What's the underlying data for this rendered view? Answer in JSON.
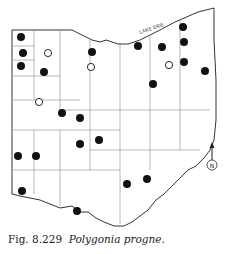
{
  "map": {
    "region": "Ohio",
    "lake_label": "LAKE ERIE",
    "compass_label": "N",
    "colors": {
      "outline": "#333333",
      "county": "#888888",
      "dot": "#111111"
    },
    "records": {
      "filled": [
        [
          21,
          37
        ],
        [
          23,
          53
        ],
        [
          21,
          66
        ],
        [
          44,
          72
        ],
        [
          92,
          52
        ],
        [
          138,
          46
        ],
        [
          183,
          27
        ],
        [
          184,
          42
        ],
        [
          162,
          47
        ],
        [
          184,
          62
        ],
        [
          205,
          71
        ],
        [
          153,
          84
        ],
        [
          62,
          113
        ],
        [
          80,
          118
        ],
        [
          80,
          144
        ],
        [
          99,
          140
        ],
        [
          18,
          156
        ],
        [
          36,
          156
        ],
        [
          22,
          191
        ],
        [
          77,
          211
        ],
        [
          127,
          184
        ],
        [
          147,
          179
        ]
      ],
      "open": [
        [
          48,
          53
        ],
        [
          91,
          67
        ],
        [
          169,
          65
        ],
        [
          39,
          102
        ]
      ]
    }
  },
  "caption": {
    "figure": "Fig. 8.229",
    "species": "Polygonia progne."
  }
}
